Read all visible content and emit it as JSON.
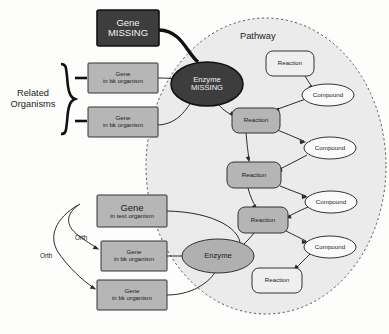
{
  "diagram": {
    "title_region": "Pathway",
    "labels": {
      "related_organisms_line1": "Related",
      "related_organisms_line2": "Organisms",
      "pathway": "Pathway",
      "orth_1": "Orth",
      "orth_2": "Orth"
    },
    "colors": {
      "missing_fill": "#3d3d3d",
      "missing_text": "#f2f2f2",
      "gene_fill": "#b6b6b6",
      "enzyme_fill": "#b0b0b0",
      "reaction_fill": "#b5b5b5",
      "reaction_empty_fill": "#efefef",
      "compound_fill": "#fafafa",
      "pathway_bg": "#ebebeb",
      "stroke": "#2a2a2a",
      "background": "#fdfdfc"
    },
    "nodes": {
      "gene_missing": {
        "type": "gene-box",
        "line1": "Gene",
        "line2": "MISSING",
        "state": "missing"
      },
      "gene_bk_top": {
        "type": "gene-box",
        "line1": "Gene",
        "line2": "in bk organism",
        "state": "normal"
      },
      "gene_bk_second": {
        "type": "gene-box",
        "line1": "Gene",
        "line2": "in bk organism",
        "state": "normal"
      },
      "enzyme_missing": {
        "type": "enzyme-ellipse",
        "line1": "Enzyme",
        "line2": "MISSING",
        "state": "missing"
      },
      "gene_test": {
        "type": "gene-box",
        "line1": "Gene",
        "line2": "in test organism",
        "state": "normal"
      },
      "gene_bk_third": {
        "type": "gene-box",
        "line1": "Gene",
        "line2": "in bk organism",
        "state": "normal"
      },
      "gene_bk_fourth": {
        "type": "gene-box",
        "line1": "Gene",
        "line2": "in bk organism",
        "state": "normal"
      },
      "enzyme": {
        "type": "enzyme-ellipse",
        "line1": "Enzyme",
        "state": "normal"
      },
      "reaction_1": {
        "type": "reaction-box",
        "label": "Reaction",
        "filled": false
      },
      "reaction_2": {
        "type": "reaction-box",
        "label": "Reaction",
        "filled": true
      },
      "reaction_3": {
        "type": "reaction-box",
        "label": "Reaction",
        "filled": true
      },
      "reaction_4": {
        "type": "reaction-box",
        "label": "Reaction",
        "filled": true
      },
      "reaction_5": {
        "type": "reaction-box",
        "label": "Reaction",
        "filled": false
      },
      "compound_1": {
        "type": "compound-ellipse",
        "label": "Compound"
      },
      "compound_2": {
        "type": "compound-ellipse",
        "label": "Compound"
      },
      "compound_3": {
        "type": "compound-ellipse",
        "label": "Compound"
      },
      "compound_4": {
        "type": "compound-ellipse",
        "label": "Compound"
      }
    }
  }
}
